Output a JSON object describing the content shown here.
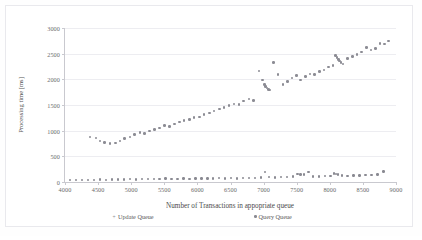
{
  "chart_data": {
    "type": "scatter",
    "title": "",
    "xlabel": "Number of Transactions in appopriate queue",
    "ylabel": "Processing time [ms]",
    "xlim": [
      4000,
      9000
    ],
    "ylim": [
      0,
      3000
    ],
    "xticks": [
      4000,
      4500,
      5000,
      5500,
      6000,
      6500,
      7000,
      7500,
      8000,
      8500,
      9000
    ],
    "yticks": [
      0,
      500,
      1000,
      1500,
      2000,
      2500,
      3000
    ],
    "grid": "horizontal",
    "legend_position": "bottom",
    "series": [
      {
        "name": "Update Queue",
        "marker": "plus",
        "color": "#8c8c94",
        "points": [
          [
            4380,
            880
          ],
          [
            4470,
            855
          ],
          [
            4530,
            800
          ],
          [
            4600,
            770
          ],
          [
            4680,
            745
          ],
          [
            4760,
            760
          ],
          [
            4830,
            800
          ],
          [
            4900,
            845
          ],
          [
            4980,
            880
          ],
          [
            5050,
            925
          ],
          [
            5130,
            960
          ],
          [
            5200,
            945
          ],
          [
            5280,
            990
          ],
          [
            5350,
            1020
          ],
          [
            5430,
            1055
          ],
          [
            5500,
            1095
          ],
          [
            5580,
            1080
          ],
          [
            5650,
            1130
          ],
          [
            5730,
            1165
          ],
          [
            5800,
            1200
          ],
          [
            5880,
            1215
          ],
          [
            5950,
            1255
          ],
          [
            6030,
            1270
          ],
          [
            6100,
            1310
          ],
          [
            6180,
            1345
          ],
          [
            6250,
            1380
          ],
          [
            6330,
            1420
          ],
          [
            6400,
            1455
          ],
          [
            6480,
            1490
          ],
          [
            6550,
            1520
          ],
          [
            6630,
            1505
          ],
          [
            6700,
            1580
          ],
          [
            6780,
            1620
          ],
          [
            6850,
            1590
          ],
          [
            6930,
            2165
          ],
          [
            6980,
            1985
          ],
          [
            7010,
            1900
          ],
          [
            7030,
            1860
          ],
          [
            7050,
            1830
          ],
          [
            7070,
            1800
          ],
          [
            7090,
            1790
          ],
          [
            7150,
            2330
          ],
          [
            7220,
            2090
          ],
          [
            7290,
            1900
          ],
          [
            7360,
            1960
          ],
          [
            7430,
            2025
          ],
          [
            7500,
            2080
          ],
          [
            7560,
            1985
          ],
          [
            7630,
            2060
          ],
          [
            7700,
            2105
          ],
          [
            7770,
            2095
          ],
          [
            7840,
            2150
          ],
          [
            7910,
            2185
          ],
          [
            7980,
            2240
          ],
          [
            8050,
            2275
          ],
          [
            8090,
            2460
          ],
          [
            8110,
            2420
          ],
          [
            8130,
            2390
          ],
          [
            8150,
            2360
          ],
          [
            8170,
            2330
          ],
          [
            8200,
            2300
          ],
          [
            8270,
            2405
          ],
          [
            8340,
            2450
          ],
          [
            8410,
            2480
          ],
          [
            8480,
            2530
          ],
          [
            8550,
            2620
          ],
          [
            8620,
            2570
          ],
          [
            8690,
            2600
          ],
          [
            8760,
            2700
          ],
          [
            8830,
            2690
          ],
          [
            8890,
            2745
          ]
        ]
      },
      {
        "name": "Query Queue",
        "marker": "dot",
        "color": "#8a8a92",
        "points": [
          [
            4080,
            40
          ],
          [
            4170,
            38
          ],
          [
            4260,
            42
          ],
          [
            4350,
            45
          ],
          [
            4440,
            40
          ],
          [
            4530,
            48
          ],
          [
            4620,
            44
          ],
          [
            4710,
            50
          ],
          [
            4800,
            46
          ],
          [
            4890,
            52
          ],
          [
            4980,
            55
          ],
          [
            5070,
            50
          ],
          [
            5160,
            58
          ],
          [
            5250,
            62
          ],
          [
            5340,
            56
          ],
          [
            5430,
            60
          ],
          [
            5520,
            65
          ],
          [
            5610,
            58
          ],
          [
            5700,
            64
          ],
          [
            5790,
            68
          ],
          [
            5880,
            62
          ],
          [
            5970,
            70
          ],
          [
            6060,
            66
          ],
          [
            6150,
            72
          ],
          [
            6240,
            68
          ],
          [
            6330,
            74
          ],
          [
            6420,
            70
          ],
          [
            6510,
            78
          ],
          [
            6600,
            72
          ],
          [
            6690,
            80
          ],
          [
            6780,
            76
          ],
          [
            6870,
            84
          ],
          [
            6960,
            88
          ],
          [
            7020,
            200
          ],
          [
            7080,
            96
          ],
          [
            7170,
            90
          ],
          [
            7260,
            98
          ],
          [
            7350,
            94
          ],
          [
            7440,
            104
          ],
          [
            7510,
            160
          ],
          [
            7560,
            150
          ],
          [
            7610,
            145
          ],
          [
            7680,
            190
          ],
          [
            7750,
            110
          ],
          [
            7840,
            105
          ],
          [
            7930,
            115
          ],
          [
            8010,
            112
          ],
          [
            8060,
            165
          ],
          [
            8090,
            155
          ],
          [
            8120,
            148
          ],
          [
            8180,
            125
          ],
          [
            8270,
            122
          ],
          [
            8360,
            130
          ],
          [
            8450,
            128
          ],
          [
            8540,
            136
          ],
          [
            8630,
            140
          ],
          [
            8720,
            145
          ],
          [
            8810,
            205
          ]
        ]
      }
    ]
  },
  "legend": {
    "items": [
      {
        "label": "Update Queue",
        "marker": "+"
      },
      {
        "label": "Query Queue",
        "marker": "•"
      }
    ]
  }
}
